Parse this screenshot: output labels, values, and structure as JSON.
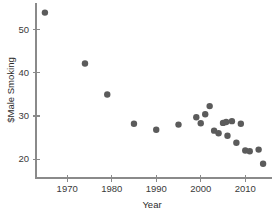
{
  "chart_data": {
    "type": "scatter",
    "title": "",
    "xlabel": "Year",
    "ylabel": "$Male Smoking",
    "xlim": [
      1963,
      2016
    ],
    "ylim": [
      17,
      56
    ],
    "xticks": [
      1970,
      1980,
      1990,
      2000,
      2010
    ],
    "yticks": [
      20,
      30,
      40,
      50
    ],
    "grid": false,
    "legend": null,
    "marker": {
      "shape": "circle",
      "color": "#5b5b5b",
      "size": 4.2
    },
    "points": [
      {
        "x": 1965,
        "y": 54.0
      },
      {
        "x": 1974,
        "y": 42.2
      },
      {
        "x": 1979,
        "y": 35.0
      },
      {
        "x": 1985,
        "y": 28.2
      },
      {
        "x": 1990,
        "y": 26.8
      },
      {
        "x": 1995,
        "y": 28.0
      },
      {
        "x": 1999,
        "y": 29.7
      },
      {
        "x": 2000,
        "y": 28.3
      },
      {
        "x": 2001,
        "y": 30.4
      },
      {
        "x": 2002,
        "y": 32.3
      },
      {
        "x": 2003,
        "y": 26.6
      },
      {
        "x": 2004,
        "y": 26.0
      },
      {
        "x": 2005,
        "y": 28.4
      },
      {
        "x": 2005.7,
        "y": 28.6
      },
      {
        "x": 2006,
        "y": 25.4
      },
      {
        "x": 2007,
        "y": 28.8
      },
      {
        "x": 2008,
        "y": 23.8
      },
      {
        "x": 2009,
        "y": 28.2
      },
      {
        "x": 2010,
        "y": 22.0
      },
      {
        "x": 2011,
        "y": 21.8
      },
      {
        "x": 2013,
        "y": 22.2
      },
      {
        "x": 2014,
        "y": 18.9
      }
    ]
  },
  "axes": {
    "x_tick_labels": [
      "1970",
      "1980",
      "1990",
      "2000",
      "2010"
    ],
    "y_tick_labels": [
      "20",
      "30",
      "40",
      "50"
    ],
    "x_axis_title": "Year",
    "y_axis_title": "$Male Smoking"
  }
}
